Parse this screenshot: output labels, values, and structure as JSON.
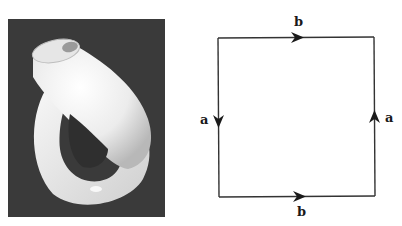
{
  "figure": {
    "photo": {
      "subject": "klein-bottle-render",
      "background_color": "#3a3a3a",
      "surface_color": "#f2f2f2"
    },
    "square": {
      "line_color": "#333333",
      "edges": [
        {
          "side": "top",
          "label": "b",
          "direction": "right"
        },
        {
          "side": "bottom",
          "label": "b",
          "direction": "right"
        },
        {
          "side": "left",
          "label": "a",
          "direction": "down"
        },
        {
          "side": "right",
          "label": "a",
          "direction": "up"
        }
      ]
    }
  }
}
